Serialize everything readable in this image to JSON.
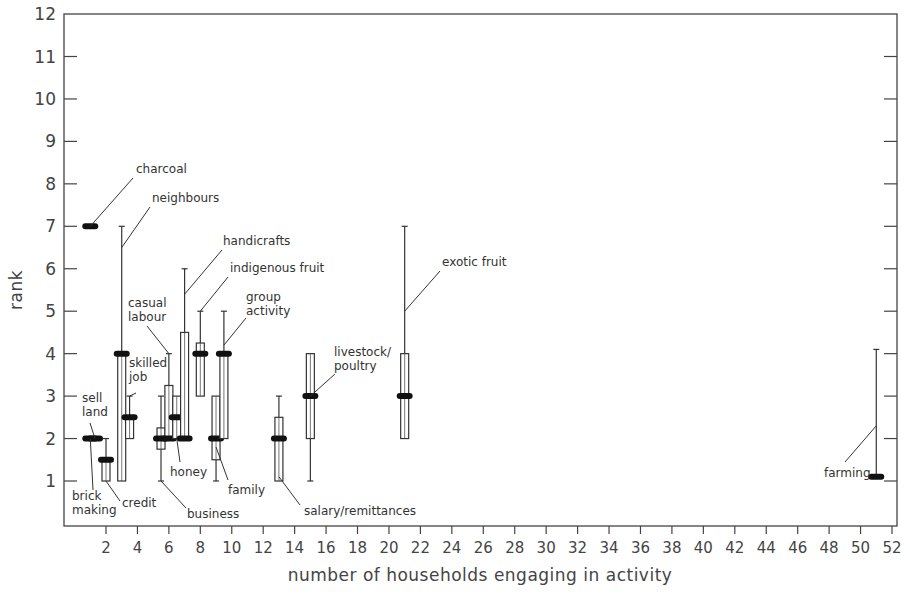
{
  "chart_data": {
    "type": "boxplot",
    "title": "",
    "xlabel": "number of households engaging in activity",
    "ylabel": "rank",
    "xlim": [
      0,
      52.5
    ],
    "ylim": [
      0,
      12
    ],
    "xticks": [
      2,
      4,
      6,
      8,
      10,
      12,
      14,
      16,
      18,
      20,
      22,
      24,
      26,
      28,
      30,
      32,
      34,
      36,
      38,
      40,
      42,
      44,
      46,
      48,
      50,
      52
    ],
    "yticks": [
      1,
      2,
      3,
      4,
      5,
      6,
      7,
      8,
      9,
      10,
      11,
      12
    ],
    "grid": false,
    "legend": null,
    "series": [
      {
        "name": "brick making",
        "x": 1.0,
        "median": 2,
        "q1": 2,
        "q3": 2,
        "min": 2,
        "max": 2,
        "label_lines": [
          "brick",
          "making"
        ]
      },
      {
        "name": "sell land",
        "x": 1.3,
        "median": 2,
        "q1": 2,
        "q3": 2,
        "min": 2,
        "max": 2,
        "label_lines": [
          "sell",
          "land"
        ]
      },
      {
        "name": "charcoal",
        "x": 1.0,
        "median": 7,
        "q1": 7,
        "q3": 7,
        "min": 7,
        "max": 7,
        "label_lines": [
          "charcoal"
        ]
      },
      {
        "name": "credit",
        "x": 2.0,
        "median": 1.5,
        "q1": 1,
        "q3": 1.5,
        "min": 1,
        "max": 2,
        "label_lines": [
          "credit"
        ]
      },
      {
        "name": "neighbours",
        "x": 3.0,
        "median": 4,
        "q1": 1,
        "q3": 4,
        "min": 1,
        "max": 7,
        "label_lines": [
          "neighbours"
        ]
      },
      {
        "name": "skilled job",
        "x": 3.5,
        "median": 2.5,
        "q1": 2,
        "q3": 2.5,
        "min": 2,
        "max": 3,
        "label_lines": [
          "skilled",
          "job"
        ]
      },
      {
        "name": "business",
        "x": 5.5,
        "median": 2,
        "q1": 1.75,
        "q3": 2.25,
        "min": 1,
        "max": 3,
        "label_lines": [
          "business"
        ]
      },
      {
        "name": "casual labour",
        "x": 6.0,
        "median": 2,
        "q1": 2,
        "q3": 3.25,
        "min": 2,
        "max": 4,
        "label_lines": [
          "casual",
          "labour"
        ]
      },
      {
        "name": "honey",
        "x": 6.5,
        "median": 2.5,
        "q1": 2,
        "q3": 3,
        "min": 2,
        "max": 3,
        "label_lines": [
          "honey"
        ]
      },
      {
        "name": "handicrafts",
        "x": 7.0,
        "median": 2,
        "q1": 2,
        "q3": 4.5,
        "min": 2,
        "max": 6,
        "label_lines": [
          "handicrafts"
        ]
      },
      {
        "name": "indigenous fruit",
        "x": 8.0,
        "median": 4,
        "q1": 3,
        "q3": 4.25,
        "min": 3,
        "max": 5,
        "label_lines": [
          "indigenous fruit"
        ]
      },
      {
        "name": "family",
        "x": 9.0,
        "median": 2,
        "q1": 1.5,
        "q3": 3,
        "min": 1,
        "max": 3,
        "label_lines": [
          "family"
        ]
      },
      {
        "name": "group activity",
        "x": 9.5,
        "median": 4,
        "q1": 2,
        "q3": 4,
        "min": 2,
        "max": 5,
        "label_lines": [
          "group",
          "activity"
        ]
      },
      {
        "name": "salary/remittances",
        "x": 13.0,
        "median": 2,
        "q1": 1,
        "q3": 2.5,
        "min": 1,
        "max": 3,
        "label_lines": [
          "salary/remittances"
        ]
      },
      {
        "name": "livestock/poultry",
        "x": 15.0,
        "median": 3,
        "q1": 2,
        "q3": 4,
        "min": 1,
        "max": 4,
        "label_lines": [
          "livestock/",
          "poultry"
        ]
      },
      {
        "name": "exotic fruit",
        "x": 21.0,
        "median": 3,
        "q1": 2,
        "q3": 4,
        "min": 2,
        "max": 7,
        "label_lines": [
          "exotic fruit"
        ]
      },
      {
        "name": "farming",
        "x": 51.0,
        "median": 1.1,
        "q1": 1.1,
        "q3": 1.1,
        "min": 1.1,
        "max": 4.1,
        "label_lines": [
          "farming"
        ]
      }
    ]
  }
}
